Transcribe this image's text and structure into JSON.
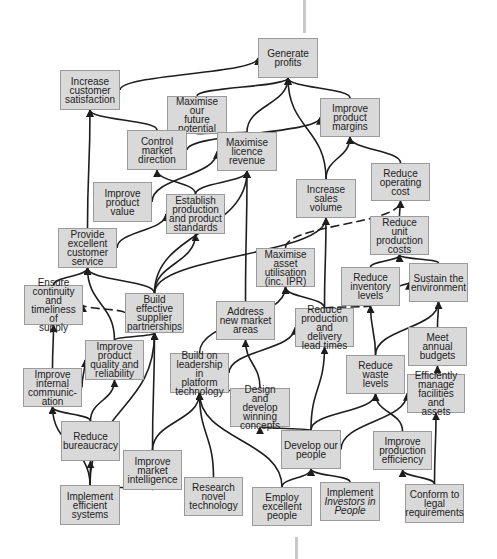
{
  "diagram": {
    "type": "strategy-map",
    "nodes": [
      {
        "id": "generate_profits",
        "label": "Generate\nprofits",
        "x": 258,
        "y": 38,
        "w": 60,
        "h": 40
      },
      {
        "id": "increase_customer_satisfaction",
        "label": "Increase\ncustomer\nsatisfaction",
        "x": 60,
        "y": 70,
        "w": 60,
        "h": 40
      },
      {
        "id": "maximise_future_potential",
        "label": "Maximise our\nfuture\npotential",
        "x": 167,
        "y": 96,
        "w": 60,
        "h": 38
      },
      {
        "id": "control_market_direction",
        "label": "Control\nmarket\ndirection",
        "x": 127,
        "y": 130,
        "w": 60,
        "h": 40
      },
      {
        "id": "maximise_licence_revenue",
        "label": "Maximise\nlicence\nrevenue",
        "x": 217,
        "y": 132,
        "w": 60,
        "h": 39
      },
      {
        "id": "improve_product_margins",
        "label": "Improve\nproduct\nmargins",
        "x": 320,
        "y": 98,
        "w": 60,
        "h": 39
      },
      {
        "id": "improve_product_value",
        "label": "Improve\nproduct value",
        "x": 93,
        "y": 182,
        "w": 59,
        "h": 40
      },
      {
        "id": "establish_production_standards",
        "label": "Establish\nproduction\nand product\nstandards",
        "x": 166,
        "y": 194,
        "w": 59,
        "h": 40
      },
      {
        "id": "increase_sales_volume",
        "label": "Increase\nsales\nvolume",
        "x": 296,
        "y": 179,
        "w": 60,
        "h": 39
      },
      {
        "id": "reduce_operating_cost",
        "label": "Reduce\noperating\ncost",
        "x": 371,
        "y": 163,
        "w": 59,
        "h": 38
      },
      {
        "id": "provide_customer_service",
        "label": "Provide\nexcellent\ncustomer\nservice",
        "x": 58,
        "y": 228,
        "w": 59,
        "h": 40
      },
      {
        "id": "maximise_asset_utilisation",
        "label": "Maximise\nasset\nutilisation\n(inc. IPR)",
        "x": 256,
        "y": 248,
        "w": 59,
        "h": 39
      },
      {
        "id": "reduce_unit_production_costs",
        "label": "Reduce unit\nproduction\ncosts",
        "x": 370,
        "y": 216,
        "w": 59,
        "h": 39
      },
      {
        "id": "reduce_inventory_levels",
        "label": "Reduce\ninventory\nlevels",
        "x": 341,
        "y": 267,
        "w": 59,
        "h": 39
      },
      {
        "id": "sustain_environment",
        "label": "Sustain the\nenvironment",
        "x": 409,
        "y": 263,
        "w": 59,
        "h": 39
      },
      {
        "id": "ensure_continuity_supply",
        "label": "Ensure\ncontinuity and\ntimeliness of\nsupply",
        "x": 24,
        "y": 285,
        "w": 59,
        "h": 40
      },
      {
        "id": "build_supplier_partnerships",
        "label": "Build\neffective\nsupplier\npartnerships",
        "x": 125,
        "y": 293,
        "w": 59,
        "h": 40
      },
      {
        "id": "address_new_market_areas",
        "label": "Address\nnew market\nareas",
        "x": 216,
        "y": 301,
        "w": 59,
        "h": 39
      },
      {
        "id": "reduce_production_lead_times",
        "label": "Reduce\nproduction\nand delivery\nlead times",
        "x": 295,
        "y": 308,
        "w": 59,
        "h": 39
      },
      {
        "id": "improve_product_quality",
        "label": "Improve\nproduct\nquality and\nreliability",
        "x": 85,
        "y": 340,
        "w": 59,
        "h": 40
      },
      {
        "id": "meet_annual_budgets",
        "label": "Meet annual\nbudgets",
        "x": 408,
        "y": 327,
        "w": 59,
        "h": 39
      },
      {
        "id": "build_on_leadership",
        "label": "Build on\nleadership in\nplatform\ntechnology",
        "x": 170,
        "y": 353,
        "w": 59,
        "h": 40
      },
      {
        "id": "improve_internal_communication",
        "label": "Improve\ninternal\ncommunic-\nation",
        "x": 23,
        "y": 368,
        "w": 59,
        "h": 39
      },
      {
        "id": "reduce_waste_levels",
        "label": "Reduce\nwaste\nlevels",
        "x": 346,
        "y": 355,
        "w": 59,
        "h": 39
      },
      {
        "id": "efficiently_manage_facilities",
        "label": "Efficiently\nmanage\nfacilities and\nassets",
        "x": 407,
        "y": 374,
        "w": 58,
        "h": 39
      },
      {
        "id": "design_develop_concepts",
        "label": "Design\nand develop\nwinning\nconcepts",
        "x": 230,
        "y": 388,
        "w": 60,
        "h": 39
      },
      {
        "id": "reduce_bureaucracy",
        "label": "Reduce\nbureaucracy",
        "x": 61,
        "y": 421,
        "w": 59,
        "h": 40
      },
      {
        "id": "develop_our_people",
        "label": "Develop our\npeople",
        "x": 281,
        "y": 430,
        "w": 60,
        "h": 39
      },
      {
        "id": "improve_production_efficiency",
        "label": "Improve\nproduction\nefficiency",
        "x": 373,
        "y": 431,
        "w": 59,
        "h": 39
      },
      {
        "id": "improve_market_intelligence",
        "label": "Improve\nmarket\nintelligence",
        "x": 123,
        "y": 450,
        "w": 59,
        "h": 40
      },
      {
        "id": "research_novel_technology",
        "label": "Research\nnovel\ntechnology",
        "x": 184,
        "y": 477,
        "w": 59,
        "h": 39
      },
      {
        "id": "implement_efficient_systems",
        "label": "Implement\nefficient\nsystems",
        "x": 60,
        "y": 485,
        "w": 60,
        "h": 40
      },
      {
        "id": "employ_excellent_people",
        "label": "Employ\nexcellent\npeople",
        "x": 252,
        "y": 487,
        "w": 60,
        "h": 39
      },
      {
        "id": "implement_investors_in_people",
        "label": "Implement\nInvestors in\nPeople",
        "x": 320,
        "y": 482,
        "w": 60,
        "h": 39,
        "italic_lines": [
          1,
          2
        ]
      },
      {
        "id": "conform_legal_requirements",
        "label": "Conform to\nlegal\nrequirements",
        "x": 405,
        "y": 484,
        "w": 59,
        "h": 39
      }
    ],
    "edges": [
      {
        "from": "increase_customer_satisfaction",
        "to": "generate_profits"
      },
      {
        "from": "maximise_future_potential",
        "to": "generate_profits"
      },
      {
        "from": "maximise_licence_revenue",
        "to": "generate_profits"
      },
      {
        "from": "improve_product_margins",
        "to": "generate_profits"
      },
      {
        "from": "increase_sales_volume",
        "to": "generate_profits"
      },
      {
        "from": "control_market_direction",
        "to": "increase_customer_satisfaction"
      },
      {
        "from": "provide_customer_service",
        "to": "increase_customer_satisfaction"
      },
      {
        "from": "control_market_direction",
        "to": "maximise_future_potential"
      },
      {
        "from": "maximise_licence_revenue",
        "to": "maximise_future_potential"
      },
      {
        "from": "establish_production_standards",
        "to": "control_market_direction"
      },
      {
        "from": "improve_product_value",
        "to": "maximise_licence_revenue"
      },
      {
        "from": "establish_production_standards",
        "to": "maximise_licence_revenue"
      },
      {
        "from": "build_supplier_partnerships",
        "to": "maximise_licence_revenue"
      },
      {
        "from": "address_new_market_areas",
        "to": "maximise_licence_revenue"
      },
      {
        "from": "control_market_direction",
        "to": "improve_product_margins"
      },
      {
        "from": "increase_sales_volume",
        "to": "improve_product_margins"
      },
      {
        "from": "reduce_operating_cost",
        "to": "improve_product_margins"
      },
      {
        "from": "reduce_production_lead_times",
        "to": "increase_sales_volume"
      },
      {
        "from": "build_supplier_partnerships",
        "to": "increase_sales_volume"
      },
      {
        "from": "reduce_unit_production_costs",
        "to": "reduce_operating_cost"
      },
      {
        "from": "maximise_asset_utilisation",
        "to": "reduce_operating_cost",
        "dashed": true
      },
      {
        "from": "provide_customer_service",
        "to": "establish_production_standards"
      },
      {
        "from": "build_supplier_partnerships",
        "to": "establish_production_standards"
      },
      {
        "from": "build_supplier_partnerships",
        "to": "provide_customer_service"
      },
      {
        "from": "ensure_continuity_supply",
        "to": "provide_customer_service"
      },
      {
        "from": "improve_product_quality",
        "to": "provide_customer_service"
      },
      {
        "from": "build_supplier_partnerships",
        "to": "ensure_continuity_supply",
        "dashed": true
      },
      {
        "from": "improve_internal_communication",
        "to": "ensure_continuity_supply"
      },
      {
        "from": "reduce_production_lead_times",
        "to": "maximise_asset_utilisation"
      },
      {
        "from": "build_on_leadership",
        "to": "maximise_asset_utilisation"
      },
      {
        "from": "reduce_inventory_levels",
        "to": "reduce_unit_production_costs"
      },
      {
        "from": "sustain_environment",
        "to": "reduce_unit_production_costs"
      },
      {
        "from": "reduce_inventory_levels",
        "to": "sustain_environment"
      },
      {
        "from": "meet_annual_budgets",
        "to": "sustain_environment"
      },
      {
        "from": "reduce_waste_levels",
        "to": "sustain_environment"
      },
      {
        "from": "reduce_production_lead_times",
        "to": "reduce_inventory_levels",
        "dashed": true
      },
      {
        "from": "reduce_waste_levels",
        "to": "reduce_inventory_levels"
      },
      {
        "from": "efficiently_manage_facilities",
        "to": "meet_annual_budgets"
      },
      {
        "from": "design_develop_concepts",
        "to": "address_new_market_areas"
      },
      {
        "from": "design_develop_concepts",
        "to": "build_on_leadership"
      },
      {
        "from": "develop_our_people",
        "to": "reduce_production_lead_times"
      },
      {
        "from": "build_on_leadership",
        "to": "reduce_production_lead_times"
      },
      {
        "from": "improve_production_efficiency",
        "to": "reduce_waste_levels"
      },
      {
        "from": "develop_our_people",
        "to": "reduce_waste_levels"
      },
      {
        "from": "develop_our_people",
        "to": "efficiently_manage_facilities"
      },
      {
        "from": "conform_legal_requirements",
        "to": "efficiently_manage_facilities"
      },
      {
        "from": "conform_legal_requirements",
        "to": "improve_production_efficiency"
      },
      {
        "from": "develop_our_people",
        "to": "design_develop_concepts"
      },
      {
        "from": "employ_excellent_people",
        "to": "develop_our_people"
      },
      {
        "from": "implement_investors_in_people",
        "to": "develop_our_people"
      },
      {
        "from": "employ_excellent_people",
        "to": "build_on_leadership"
      },
      {
        "from": "research_novel_technology",
        "to": "build_on_leadership"
      },
      {
        "from": "improve_market_intelligence",
        "to": "build_on_leadership"
      },
      {
        "from": "improve_market_intelligence",
        "to": "build_supplier_partnerships"
      },
      {
        "from": "improve_product_quality",
        "to": "build_supplier_partnerships"
      },
      {
        "from": "reduce_bureaucracy",
        "to": "improve_product_quality"
      },
      {
        "from": "improve_internal_communication",
        "to": "improve_product_quality"
      },
      {
        "from": "reduce_bureaucracy",
        "to": "improve_internal_communication"
      },
      {
        "from": "implement_efficient_systems",
        "to": "reduce_bureaucracy"
      },
      {
        "from": "implement_efficient_systems",
        "to": "improve_internal_communication"
      },
      {
        "from": "implement_efficient_systems",
        "to": "improve_market_intelligence"
      },
      {
        "from": "implement_efficient_systems",
        "to": "build_supplier_partnerships"
      }
    ],
    "colors": {
      "node_fill": "#d9d9d9",
      "node_border": "#9a9a9a",
      "edge": "#1e1e1e",
      "spine": "#c8c8c8",
      "text": "#222222"
    }
  }
}
